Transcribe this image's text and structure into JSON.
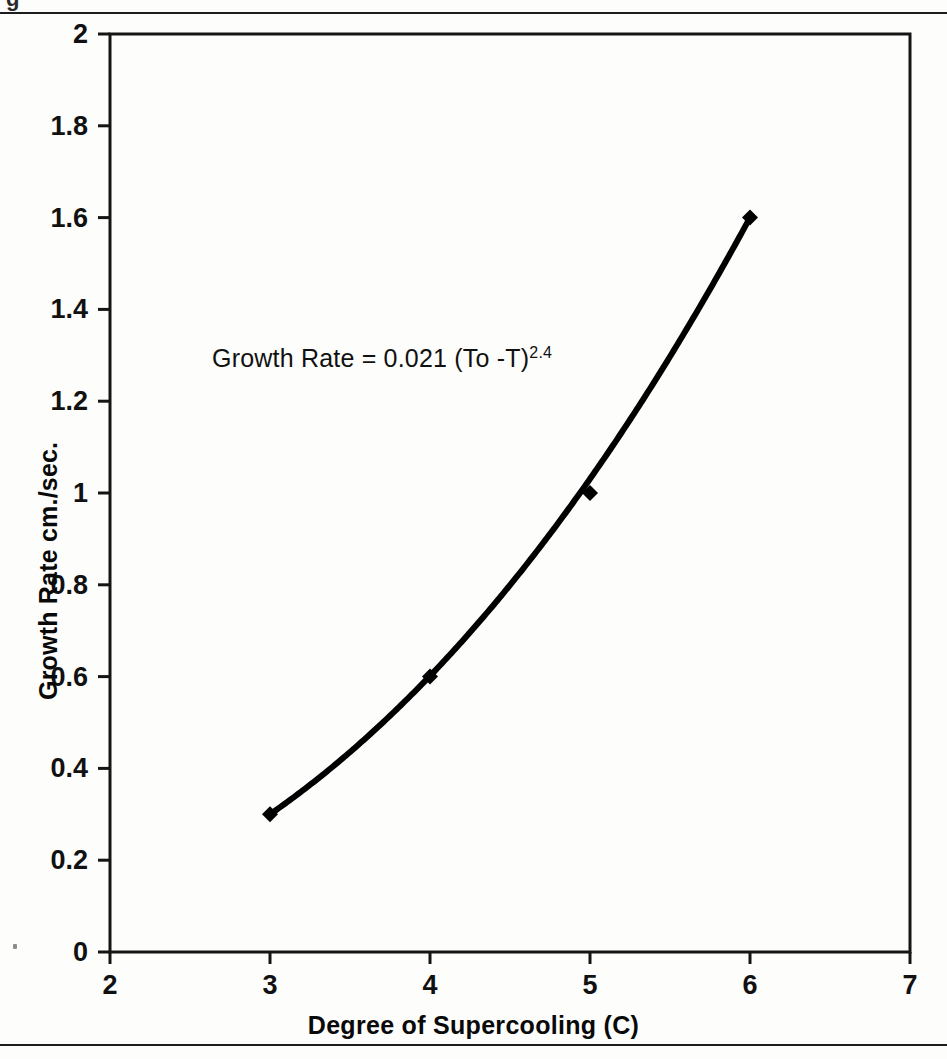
{
  "figure": {
    "cut_glyph": "g",
    "equation": {
      "base": "Growth Rate  =  0.021 (To -T)",
      "exponent": "2.4"
    }
  },
  "chart_data": {
    "type": "line",
    "title": "",
    "subtitle": "",
    "xlabel": "Degree of Supercooling (C)",
    "ylabel": "Growth Rate cm./sec.",
    "xlim": [
      2,
      7
    ],
    "ylim": [
      0,
      2
    ],
    "grid": false,
    "legend": "none",
    "x_ticks": [
      "2",
      "3",
      "4",
      "5",
      "6",
      "7"
    ],
    "x_tick_values": [
      2,
      3,
      4,
      5,
      6,
      7
    ],
    "y_ticks": [
      "2",
      "1.8",
      "1.6",
      "1.4",
      "1.2",
      "1",
      "0.8",
      "0.6",
      "0.4",
      "0.2",
      "0"
    ],
    "y_tick_values": [
      2,
      1.8,
      1.6,
      1.4,
      1.2,
      1,
      0.8,
      0.6,
      0.4,
      0.2,
      0
    ],
    "marker": "diamond",
    "line_color": "#000000",
    "marker_color": "#000000",
    "series": [
      {
        "name": "Growth Rate",
        "x": [
          3,
          4,
          5,
          6
        ],
        "values": [
          0.3,
          0.6,
          1.0,
          1.6
        ]
      }
    ],
    "fit_curve": {
      "expression": "0.021 * (To - T)^2.4",
      "coefficient": 0.021,
      "exponent": 2.4,
      "x_start": 3,
      "x_end": 6
    },
    "annotations": [
      {
        "text": "Growth Rate = 0.021 (To -T)^2.4",
        "x": 3.3,
        "y": 1.28
      }
    ]
  }
}
